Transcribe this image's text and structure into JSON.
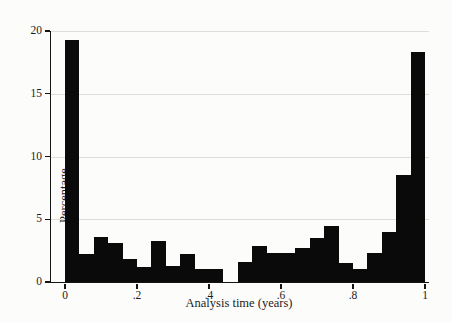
{
  "figure": {
    "background_color": "#fcfcfa",
    "bar_color": "#0a0a0a",
    "axis_color": "#141414",
    "gridline_color": "#deded8"
  },
  "chart_data": {
    "type": "bar",
    "subtype": "histogram",
    "title": "",
    "xlabel": "Analysis time (years)",
    "ylabel": "Percentage",
    "xlim": [
      0,
      1
    ],
    "ylim": [
      0,
      20
    ],
    "x_tick_labels": [
      "0",
      ".2",
      ".4",
      ".6",
      ".8",
      "1"
    ],
    "x_tick_values": [
      0,
      0.2,
      0.4,
      0.6,
      0.8,
      1
    ],
    "y_tick_labels": [
      "0",
      "5",
      "10",
      "15",
      "20"
    ],
    "y_tick_values": [
      0,
      5,
      10,
      15,
      20
    ],
    "grid": "horizontal gridlines at y = 5, 10, 15, 20",
    "legend": "none",
    "bin_width": 0.04,
    "bin_starts": [
      0.0,
      0.04,
      0.08,
      0.12,
      0.16,
      0.2,
      0.24,
      0.28,
      0.32,
      0.36,
      0.4,
      0.44,
      0.48,
      0.52,
      0.56,
      0.6,
      0.64,
      0.68,
      0.72,
      0.76,
      0.8,
      0.84,
      0.88,
      0.92,
      0.96
    ],
    "values": [
      19.3,
      2.2,
      3.6,
      3.1,
      1.8,
      1.2,
      3.3,
      1.3,
      2.2,
      1.0,
      1.0,
      0,
      1.6,
      2.9,
      2.3,
      2.3,
      2.7,
      3.5,
      4.5,
      1.5,
      1.0,
      2.3,
      4.0,
      8.5,
      18.3
    ]
  }
}
